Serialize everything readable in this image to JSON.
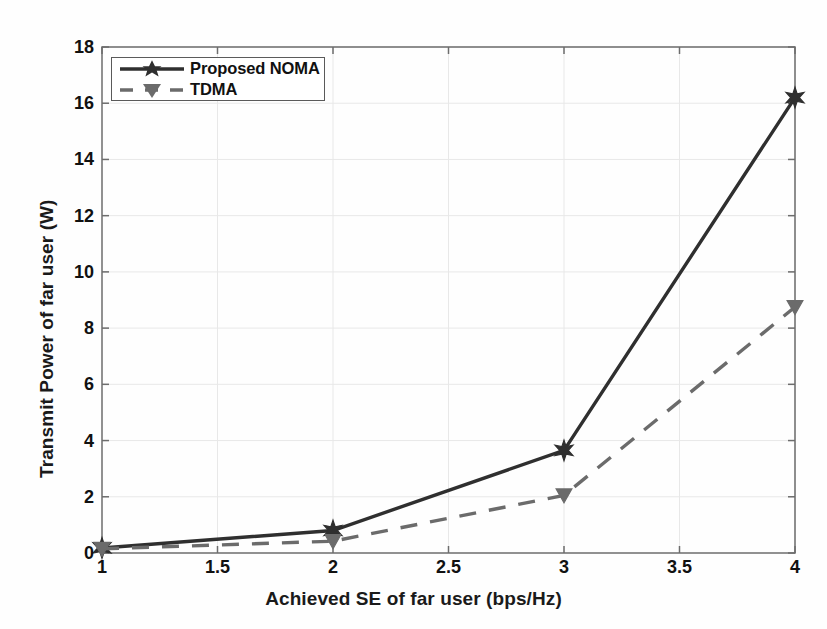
{
  "chart_data": {
    "type": "line",
    "title": "",
    "xlabel": "Achieved SE of far user (bps/Hz)",
    "ylabel": "Transmit Power of far user (W)",
    "xlim": [
      1,
      4
    ],
    "ylim": [
      0,
      18
    ],
    "xticks": [
      1,
      1.5,
      2,
      2.5,
      3,
      3.5,
      4
    ],
    "xtick_labels": [
      "1",
      "1.5",
      "2",
      "2.5",
      "3",
      "3.5",
      "4"
    ],
    "yticks": [
      0,
      2,
      4,
      6,
      8,
      10,
      12,
      14,
      16,
      18
    ],
    "ytick_labels": [
      "0",
      "2",
      "4",
      "6",
      "8",
      "10",
      "12",
      "14",
      "16",
      "18"
    ],
    "grid": true,
    "legend_position": "upper left",
    "x": [
      1,
      2,
      3,
      4
    ],
    "series": [
      {
        "name": "Proposed NOMA",
        "values": [
          0.18,
          0.8,
          3.65,
          16.2
        ],
        "color": "#2f2f2f",
        "linestyle": "solid",
        "marker": "star",
        "marker_size": 16,
        "line_width": 3.4
      },
      {
        "name": "TDMA",
        "values": [
          0.15,
          0.42,
          2.05,
          8.75
        ],
        "color": "#6b6b6b",
        "linestyle": "dashed",
        "marker": "triangle-down",
        "marker_size": 15,
        "line_width": 3.4
      }
    ]
  },
  "legend": {
    "entries": [
      {
        "label": "Proposed NOMA"
      },
      {
        "label": "TDMA"
      }
    ]
  },
  "colors": {
    "background": "#fefefe",
    "axis": "#6d6d6d",
    "grid": "#e8e8e8",
    "text": "#111111",
    "noma": "#2f2f2f",
    "tdma": "#6b6b6b"
  }
}
